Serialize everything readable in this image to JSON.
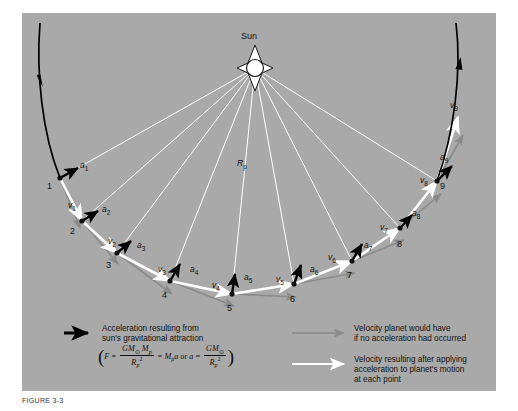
{
  "figure": {
    "caption": "FIGURE 3-3",
    "sun_label": "Sun",
    "radius_label": "R",
    "radius_sub": "p",
    "background_color": "#a9a9a9",
    "accel_color": "#000000",
    "velocity_applied_color": "#ffffff",
    "velocity_nograv_color": "#8a8a8a"
  },
  "points": [
    {
      "num": "1",
      "x": 38,
      "y": 165,
      "nx": 25,
      "ny": 168
    },
    {
      "num": "2",
      "x": 60,
      "y": 208,
      "nx": 48,
      "ny": 213
    },
    {
      "num": "3",
      "x": 95,
      "y": 240,
      "nx": 84,
      "ny": 247
    },
    {
      "num": "4",
      "x": 148,
      "y": 268,
      "nx": 140,
      "ny": 277
    },
    {
      "num": "5",
      "x": 210,
      "y": 281,
      "nx": 205,
      "ny": 290
    },
    {
      "num": "6",
      "x": 272,
      "y": 271,
      "nx": 268,
      "ny": 281
    },
    {
      "num": "7",
      "x": 330,
      "y": 248,
      "nx": 325,
      "ny": 257
    },
    {
      "num": "8",
      "x": 378,
      "y": 215,
      "nx": 375,
      "ny": 226
    },
    {
      "num": "9",
      "x": 415,
      "y": 168,
      "nx": 418,
      "ny": 168
    }
  ],
  "accel_labels": [
    {
      "text": "a",
      "sub": "1",
      "x": 58,
      "y": 148
    },
    {
      "text": "a",
      "sub": "2",
      "x": 80,
      "y": 192
    },
    {
      "text": "a",
      "sub": "3",
      "x": 115,
      "y": 228
    },
    {
      "text": "a",
      "sub": "4",
      "x": 168,
      "y": 252
    },
    {
      "text": "a",
      "sub": "5",
      "x": 222,
      "y": 260
    },
    {
      "text": "a",
      "sub": "6",
      "x": 288,
      "y": 252
    },
    {
      "text": "a",
      "sub": "7",
      "x": 342,
      "y": 228
    },
    {
      "text": "a",
      "sub": "8",
      "x": 390,
      "y": 196
    },
    {
      "text": "a",
      "sub": "9",
      "x": 418,
      "y": 140
    }
  ],
  "velocity_labels": [
    {
      "text": "v",
      "sub": "1",
      "x": 46,
      "y": 188
    },
    {
      "text": "v",
      "sub": "2",
      "x": 86,
      "y": 224
    },
    {
      "text": "v",
      "sub": "3",
      "x": 136,
      "y": 252
    },
    {
      "text": "v",
      "sub": "4",
      "x": 190,
      "y": 268
    },
    {
      "text": "v",
      "sub": "5",
      "x": 254,
      "y": 262
    },
    {
      "text": "v",
      "sub": "6",
      "x": 306,
      "y": 240
    },
    {
      "text": "v",
      "sub": "7",
      "x": 358,
      "y": 210
    },
    {
      "text": "v",
      "sub": "8",
      "x": 398,
      "y": 163
    },
    {
      "text": "v",
      "sub": "9",
      "x": 428,
      "y": 88
    }
  ],
  "legend": {
    "accel": {
      "line1": "Acceleration resulting from",
      "line2": "sun's gravitational attraction",
      "formula": {
        "F": "F",
        "eq1": "=",
        "num1": "GM",
        "num1_sun": "⊙",
        "num1_mp": "M",
        "num1_mp_sub": "p",
        "den1": "R",
        "den1_sub": "p",
        "den1_sup": "2",
        "eq2": "=",
        "mid": "M",
        "mid_sub": "p",
        "mid_a": "a",
        "or": "or",
        "a": "a",
        "eq3": "=",
        "num2": "GM",
        "num2_sun": "⊙",
        "den2": "R",
        "den2_sub": "p",
        "den2_sup": "2"
      }
    },
    "velocity_nograv": {
      "line1": "Velocity planet would have",
      "line2": "if no acceleration had occurred"
    },
    "velocity_applied": {
      "line1": "Velocity resulting after applying",
      "line2": "acceleration to planet's motion",
      "line3": "at each point"
    }
  }
}
